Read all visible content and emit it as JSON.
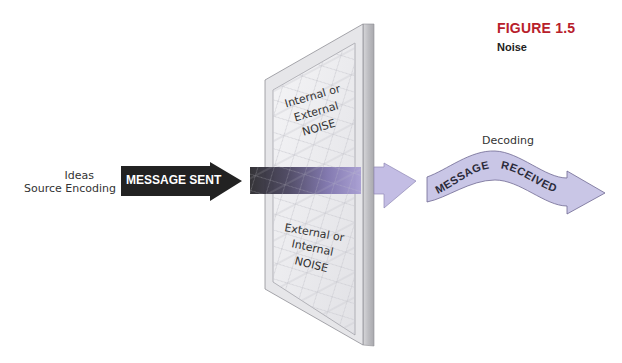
{
  "figure": {
    "label": "FIGURE 1.5",
    "title": "Noise"
  },
  "source": {
    "line1": "Ideas",
    "line2": "Source Encoding"
  },
  "sent_arrow": {
    "label": "MESSAGE SENT",
    "color": "#222222"
  },
  "panel": {
    "top_text": [
      "Internal or",
      "External",
      "NOISE"
    ],
    "bottom_text": [
      "External or",
      "Internal",
      "NOISE"
    ],
    "frame_color": "#e4e4e6",
    "side_color": "#b9b9bd",
    "mesh_color": "#c9c9cf"
  },
  "received": {
    "stage_label": "Decoding",
    "word1": "MESSAGE",
    "word2": "RECEIVED",
    "color": "#c9c6e6"
  },
  "colors": {
    "figure_label": "#b8202b",
    "gradient_start": "#2b2a2e",
    "gradient_end": "#a59bd0",
    "arrow_light": "#c6c1e6"
  }
}
